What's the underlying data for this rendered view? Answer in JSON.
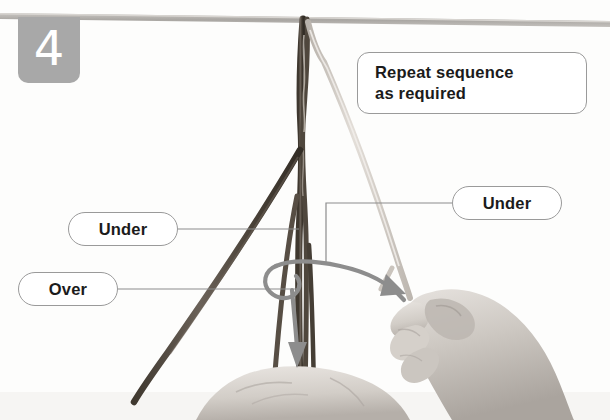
{
  "step": {
    "number": "4"
  },
  "callouts": [
    {
      "id": "repeat",
      "line1": "Repeat sequence",
      "line2": "as required"
    },
    {
      "id": "under_left",
      "label": "Under"
    },
    {
      "id": "over",
      "label": "Over"
    },
    {
      "id": "under_right",
      "label": "Under"
    }
  ],
  "colors": {
    "badge_gray": "#a8a8a8",
    "badge_text": "#ffffff",
    "callout_border": "#9a9a9a",
    "callout_fill": "#ffffff",
    "callout_text": "#1b1b1b",
    "cord_dark": "#5a5149",
    "cord_light": "#cfcac4",
    "arrow_gray": "#8d8d8d",
    "bar_gray": "#b3b0ac",
    "hand_gray": "#cbc6c1",
    "background": "#fdfdfc"
  },
  "scene": {
    "description": "Grayscale photo: a horizontal rod across the top with braided cords hanging down; a right hand grips a light cord, a second hand at bottom centre holds the dark cords; a curved motion arrow loops around the cords and points downward.",
    "elements": [
      "horizontal-bar",
      "dark-braided-cord",
      "light-cord",
      "right-hand",
      "bottom-hand",
      "motion-arrow"
    ]
  }
}
